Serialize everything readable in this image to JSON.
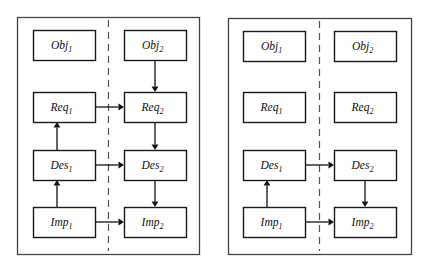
{
  "figure": {
    "background_color": "#ffffff",
    "line_color": "#111111",
    "frame_color": "#444444",
    "divider_color": "#555555",
    "node_fill": "#ffffff"
  },
  "panels": [
    {
      "id": "left-panel",
      "name": "panel-left",
      "frame": {
        "x": 17,
        "y": 17,
        "w": 182,
        "h": 237
      },
      "divider": {
        "x": 108,
        "y1": 17,
        "y2": 254
      },
      "nodes": [
        {
          "id": "l-obj1",
          "name": "node-obj1",
          "base": "Obj",
          "sub": "1",
          "x": 33,
          "y": 30,
          "w": 62,
          "h": 30
        },
        {
          "id": "l-obj2",
          "name": "node-obj2",
          "base": "Obj",
          "sub": "2",
          "x": 124,
          "y": 30,
          "w": 62,
          "h": 30
        },
        {
          "id": "l-req1",
          "name": "node-req1",
          "base": "Req",
          "sub": "1",
          "x": 33,
          "y": 92,
          "w": 62,
          "h": 30
        },
        {
          "id": "l-req2",
          "name": "node-req2",
          "base": "Req",
          "sub": "2",
          "x": 124,
          "y": 92,
          "w": 62,
          "h": 30
        },
        {
          "id": "l-des1",
          "name": "node-des1",
          "base": "Des",
          "sub": "1",
          "x": 33,
          "y": 150,
          "w": 62,
          "h": 30
        },
        {
          "id": "l-des2",
          "name": "node-des2",
          "base": "Des",
          "sub": "2",
          "x": 124,
          "y": 150,
          "w": 62,
          "h": 30
        },
        {
          "id": "l-imp1",
          "name": "node-imp1",
          "base": "Imp",
          "sub": "1",
          "x": 33,
          "y": 207,
          "w": 62,
          "h": 30
        },
        {
          "id": "l-imp2",
          "name": "node-imp2",
          "base": "Imp",
          "sub": "2",
          "x": 124,
          "y": 207,
          "w": 62,
          "h": 30
        }
      ],
      "edges": [
        {
          "id": "l-e1",
          "name": "edge-obj2-to-req2",
          "from": "Obj2",
          "to": "Req2",
          "dir": "down",
          "x1": 155,
          "y1": 60,
          "x2": 155,
          "y2": 92
        },
        {
          "id": "l-e2",
          "name": "edge-req1-to-req2",
          "from": "Req1",
          "to": "Req2",
          "dir": "right",
          "x1": 95,
          "y1": 107,
          "x2": 124,
          "y2": 107
        },
        {
          "id": "l-e3",
          "name": "edge-req2-to-des2",
          "from": "Req2",
          "to": "Des2",
          "dir": "down",
          "x1": 155,
          "y1": 122,
          "x2": 155,
          "y2": 150
        },
        {
          "id": "l-e4",
          "name": "edge-des1-to-req1",
          "from": "Des1",
          "to": "Req1",
          "dir": "up",
          "x1": 57,
          "y1": 150,
          "x2": 57,
          "y2": 122
        },
        {
          "id": "l-e5",
          "name": "edge-des1-to-des2",
          "from": "Des1",
          "to": "Des2",
          "dir": "right",
          "x1": 95,
          "y1": 165,
          "x2": 124,
          "y2": 165
        },
        {
          "id": "l-e6",
          "name": "edge-des2-to-imp2",
          "from": "Des2",
          "to": "Imp2",
          "dir": "down",
          "x1": 155,
          "y1": 180,
          "x2": 155,
          "y2": 207
        },
        {
          "id": "l-e7",
          "name": "edge-imp1-to-des1",
          "from": "Imp1",
          "to": "Des1",
          "dir": "up",
          "x1": 57,
          "y1": 207,
          "x2": 57,
          "y2": 180
        },
        {
          "id": "l-e8",
          "name": "edge-imp1-to-imp2",
          "from": "Imp1",
          "to": "Imp2",
          "dir": "right",
          "x1": 95,
          "y1": 222,
          "x2": 124,
          "y2": 222
        }
      ]
    },
    {
      "id": "right-panel",
      "name": "panel-right",
      "frame": {
        "x": 228,
        "y": 18,
        "w": 183,
        "h": 236
      },
      "divider": {
        "x": 319,
        "y1": 18,
        "y2": 254
      },
      "nodes": [
        {
          "id": "r-obj1",
          "name": "node-obj1",
          "base": "Obj",
          "sub": "1",
          "x": 243,
          "y": 31,
          "w": 62,
          "h": 30
        },
        {
          "id": "r-obj2",
          "name": "node-obj2",
          "base": "Obj",
          "sub": "2",
          "x": 334,
          "y": 31,
          "w": 62,
          "h": 30
        },
        {
          "id": "r-req1",
          "name": "node-req1",
          "base": "Req",
          "sub": "1",
          "x": 243,
          "y": 92,
          "w": 62,
          "h": 30
        },
        {
          "id": "r-req2",
          "name": "node-req2",
          "base": "Req",
          "sub": "2",
          "x": 334,
          "y": 92,
          "w": 62,
          "h": 30
        },
        {
          "id": "r-des1",
          "name": "node-des1",
          "base": "Des",
          "sub": "1",
          "x": 243,
          "y": 150,
          "w": 62,
          "h": 30
        },
        {
          "id": "r-des2",
          "name": "node-des2",
          "base": "Des",
          "sub": "2",
          "x": 334,
          "y": 150,
          "w": 62,
          "h": 30
        },
        {
          "id": "r-imp1",
          "name": "node-imp1",
          "base": "Imp",
          "sub": "1",
          "x": 243,
          "y": 207,
          "w": 62,
          "h": 30
        },
        {
          "id": "r-imp2",
          "name": "node-imp2",
          "base": "Imp",
          "sub": "2",
          "x": 334,
          "y": 207,
          "w": 62,
          "h": 30
        }
      ],
      "edges": [
        {
          "id": "r-e1",
          "name": "edge-des1-to-des2",
          "from": "Des1",
          "to": "Des2",
          "dir": "right",
          "x1": 305,
          "y1": 165,
          "x2": 334,
          "y2": 165
        },
        {
          "id": "r-e2",
          "name": "edge-des2-to-imp2",
          "from": "Des2",
          "to": "Imp2",
          "dir": "down",
          "x1": 365,
          "y1": 180,
          "x2": 365,
          "y2": 207
        },
        {
          "id": "r-e3",
          "name": "edge-imp1-to-des1",
          "from": "Imp1",
          "to": "Des1",
          "dir": "up",
          "x1": 267,
          "y1": 207,
          "x2": 267,
          "y2": 180
        },
        {
          "id": "r-e4",
          "name": "edge-imp1-to-imp2",
          "from": "Imp1",
          "to": "Imp2",
          "dir": "right",
          "x1": 305,
          "y1": 222,
          "x2": 334,
          "y2": 222
        }
      ]
    }
  ]
}
